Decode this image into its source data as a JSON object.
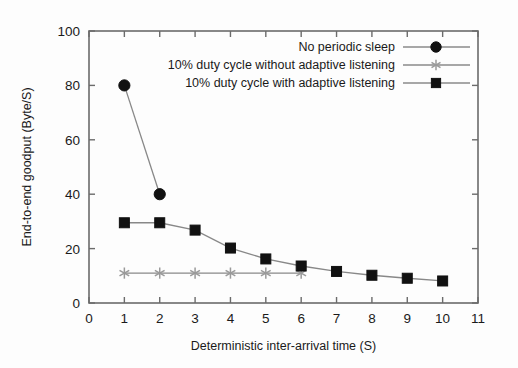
{
  "chart_data": {
    "type": "line",
    "title": "",
    "xlabel": "Deterministic inter-arrival time (S)",
    "ylabel": "End-to-end goodput (Byte/S)",
    "xlim": [
      0,
      11
    ],
    "ylim": [
      0,
      100
    ],
    "xticks": [
      "0",
      "1",
      "2",
      "3",
      "4",
      "5",
      "6",
      "7",
      "8",
      "9",
      "10",
      "11"
    ],
    "yticks": [
      "0",
      "20",
      "40",
      "60",
      "80",
      "100"
    ],
    "grid": false,
    "legend_position": "top-right",
    "series": [
      {
        "name": "No periodic sleep",
        "marker": "circle",
        "x": [
          1,
          2
        ],
        "values": [
          80,
          40
        ]
      },
      {
        "name": "10% duty cycle without adaptive listening",
        "marker": "star",
        "x": [
          1,
          2,
          3,
          4,
          5,
          6
        ],
        "values": [
          11,
          11,
          11,
          11,
          11,
          11
        ]
      },
      {
        "name": "10% duty cycle with adaptive listening",
        "marker": "square",
        "x": [
          1,
          2,
          3,
          4,
          5,
          6,
          7,
          8,
          9,
          10
        ],
        "values": [
          29.5,
          29.5,
          26.8,
          20.2,
          16.2,
          13.6,
          11.6,
          10.2,
          9.1,
          8.1
        ]
      }
    ]
  },
  "colors": {
    "marker_dark": "#111111",
    "line_gray": "#888888",
    "axis_gray": "#6b6b6b",
    "star_gray": "#9a9a9a",
    "background": "#fdfdfd"
  }
}
